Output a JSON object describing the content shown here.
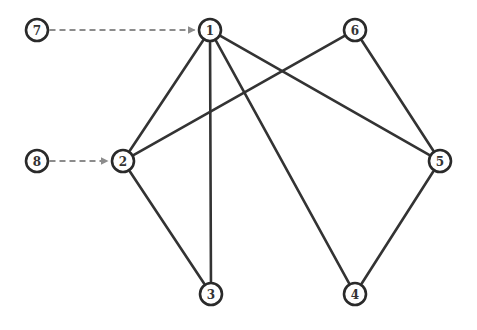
{
  "colors": {
    "edge": "#333333",
    "dashed_edge": "#8c8c8c",
    "node_stroke": "#2a2a2a",
    "background": "#ffffff"
  },
  "graph": {
    "nodes": [
      {
        "id": "1",
        "label": "1",
        "x": 210,
        "y": 30
      },
      {
        "id": "2",
        "label": "2",
        "x": 123,
        "y": 161
      },
      {
        "id": "3",
        "label": "3",
        "x": 211,
        "y": 294
      },
      {
        "id": "4",
        "label": "4",
        "x": 355,
        "y": 294
      },
      {
        "id": "5",
        "label": "5",
        "x": 440,
        "y": 161
      },
      {
        "id": "6",
        "label": "6",
        "x": 355,
        "y": 30
      },
      {
        "id": "7",
        "label": "7",
        "x": 37,
        "y": 30
      },
      {
        "id": "8",
        "label": "8",
        "x": 37,
        "y": 161
      }
    ],
    "edges": [
      {
        "from": "1",
        "to": "2",
        "style": "solid"
      },
      {
        "from": "1",
        "to": "3",
        "style": "solid"
      },
      {
        "from": "1",
        "to": "4",
        "style": "solid"
      },
      {
        "from": "1",
        "to": "5",
        "style": "solid"
      },
      {
        "from": "2",
        "to": "6",
        "style": "solid"
      },
      {
        "from": "2",
        "to": "3",
        "style": "solid"
      },
      {
        "from": "6",
        "to": "5",
        "style": "solid"
      },
      {
        "from": "5",
        "to": "4",
        "style": "solid"
      },
      {
        "from": "7",
        "to": "1",
        "style": "dashed-arrow"
      },
      {
        "from": "8",
        "to": "2",
        "style": "dashed-arrow"
      }
    ],
    "node_radius": 11
  }
}
